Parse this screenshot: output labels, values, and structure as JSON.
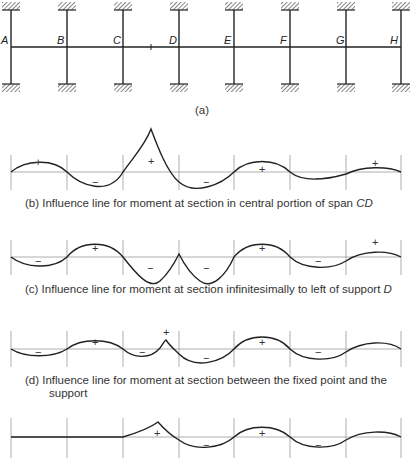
{
  "frame": {
    "joints": [
      "A",
      "B",
      "C",
      "D",
      "E",
      "F",
      "G",
      "H"
    ],
    "caption": "(a)"
  },
  "panels": [
    {
      "id": "b",
      "caption": "(b)  Influence line for moment at section in central portion of span ",
      "caption_italic": "CD",
      "signs": [
        "+",
        "−",
        "+",
        "−",
        "+",
        "−",
        "+"
      ]
    },
    {
      "id": "c",
      "caption": "(c)  Influence line for moment at section infinitesimally to left of support ",
      "caption_italic": "D",
      "signs": [
        "−",
        "+",
        "−",
        "−",
        "+",
        "−",
        "+"
      ]
    },
    {
      "id": "d",
      "caption": "(d)  Influence line for moment at section between the fixed point and the",
      "caption_line2": "support",
      "signs": [
        "−",
        "+",
        "−",
        "+",
        "−",
        "+",
        "−"
      ]
    },
    {
      "id": "e",
      "signs": [
        "+",
        "−",
        "+",
        "−"
      ]
    }
  ]
}
